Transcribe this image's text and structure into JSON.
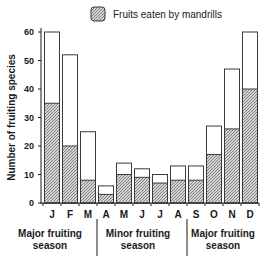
{
  "chart_data": {
    "type": "bar",
    "stacked": "overlay",
    "title": "",
    "xlabel": "",
    "ylabel": "Number of fruiting species",
    "ylim": [
      0,
      60
    ],
    "yticks": [
      0,
      10,
      20,
      30,
      40,
      50,
      60
    ],
    "categories": [
      "J",
      "F",
      "M",
      "A",
      "M",
      "J",
      "J",
      "A",
      "S",
      "O",
      "N",
      "D"
    ],
    "series": [
      {
        "name": "Total fruiting species",
        "fill": "none",
        "values": [
          60,
          52,
          25,
          6,
          14,
          12,
          10,
          13,
          13,
          27,
          47,
          60
        ]
      },
      {
        "name": "Fruits eaten by mandrills",
        "fill": "hatched",
        "values": [
          35,
          20,
          8,
          3,
          10,
          9,
          7,
          8,
          8,
          17,
          26,
          40
        ]
      }
    ],
    "legend": {
      "position": "top-right",
      "entries": [
        "Fruits eaten by mandrills"
      ]
    },
    "grid": false,
    "annotations": [
      {
        "text_lines": [
          "Major fruiting",
          "season"
        ],
        "span": [
          "J",
          "M"
        ]
      },
      {
        "text_lines": [
          "Minor fruiting",
          "season"
        ],
        "span": [
          "A",
          "A"
        ]
      },
      {
        "text_lines": [
          "Major fruiting",
          "season"
        ],
        "span": [
          "S",
          "D"
        ]
      }
    ]
  },
  "colors": {
    "axis": "#1a1a1a",
    "bar_outline": "#3a3a3a",
    "hatch_fg": "#555555",
    "hatch_bg": "#d8d8d8"
  }
}
